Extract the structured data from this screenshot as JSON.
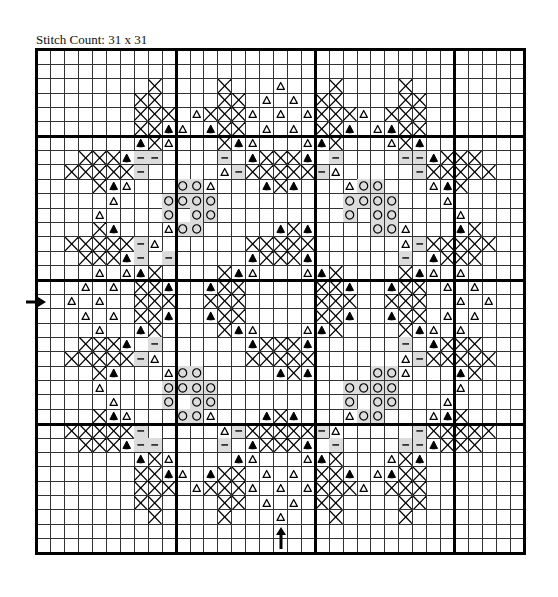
{
  "title": "Stitch Count: 31 x 31",
  "grid": {
    "columns": 35,
    "rows": 35,
    "thick_columns": [
      0,
      10,
      20,
      30,
      35
    ],
    "thick_rows": [
      0,
      6,
      16,
      26,
      35
    ],
    "center_column": 17,
    "center_row": 17,
    "legend_codes": {
      "X": "cross-stitch",
      "B": "filled-triangle",
      "T": "open-triangle",
      "O": "circle",
      "D": "dash-on-grey",
      ".": "empty"
    },
    "colors": {
      "line": "#333333",
      "thick_line": "#000000",
      "shade": "#dcdcdc",
      "symbol": "#000000"
    },
    "cells": [
      "...................................",
      "...................................",
      "........X....X...T...X....X........",
      ".......XX....XX.T.T.XX....XX.......",
      ".......XXX.TXXXT.T.TXXXT.XXX.......",
      ".......XXBT.BXX.T.T.XXB.TBXX.......",
      ".......BXT...XBT...TBX...TXB.......",
      "...XXXBDD....D.BXXXB.D....DDBXXX...",
      "..XXXXXD.....TDXXXXXDT.....DXXXXX..",
      "....XBT...OOT...BXB...TOO...TBX....",
      ".....T...OOOO.........OOOO...T.....",
      "....T....O.OO.........O.OO....T....",
      "....XB...TOO.....BXB....OOT...BX...",
      "..XXXXXDT......XXXXX......TDXXXXX..",
      "...XXXBD.D.....BXXXB......D.BXXX...",
      "....T.TBX....XBT...TBX....XBT.T....",
      "...T.T.XXB..BXX.....XXB..BXX.T.T...",
      "..T.T..XXX..XXX.....XXX..XXX..T.T..",
      "...T.T.XXB..BXX.....XXB..BXX.T.T...",
      "....T..BX....XBT...TBX....XBT.T....",
      "...XXXB.D......BXXXB......D.BXXX...",
      "..XXXXXDT......XXXXX......TDXXXXX..",
      "....XB...TOO.....BXB....OOT...BX...",
      "....T....OOOO.........OOOO....T....",
      ".....T...O.OO.........O.OO...T.....",
      "....XBT...OOT...BXB...TOO...TBX....",
      "..XXXXXD.....TDXXXXXDT.....DXXXXX..",
      "...XXXBDD....D.BXXXB.D....DDBXXX...",
      ".......BXT....BT...TBX...TXB.......",
      ".......XXBT.BXX.T.T.XXB.TBXX.......",
      ".......XXX.TXXXT.T.TXXXT.XXX.......",
      ".......XX....XX.T.T.XX....XX.......",
      "........X....X...T...X....X........",
      "...................................",
      "..................................."
    ]
  },
  "markers": {
    "left_arrow": {
      "row": 17,
      "icon": "arrow-right-icon"
    },
    "bottom_arrow": {
      "column": 17,
      "icon": "arrow-up-icon"
    }
  }
}
